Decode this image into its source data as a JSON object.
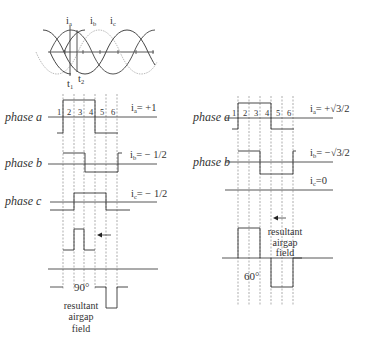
{
  "sine_plot": {
    "labels": [
      "i",
      "i",
      "i"
    ],
    "label_subs": [
      "a",
      "b",
      "c"
    ],
    "time_markers": [
      "t",
      "t"
    ],
    "time_subs": [
      "1",
      "2"
    ]
  },
  "left_panel": {
    "phases": [
      {
        "label": "phase a",
        "current_label": "i",
        "current_sub": "a",
        "current_value": "= +1"
      },
      {
        "label": "phase b",
        "current_label": "i",
        "current_sub": "b",
        "current_value": "= − 1/2"
      },
      {
        "label": "phase c",
        "current_label": "i",
        "current_sub": "c",
        "current_value": "= − 1/2"
      }
    ],
    "intervals": [
      "1",
      "2",
      "3",
      "4",
      "5",
      "6"
    ],
    "angle": "90°",
    "caption": [
      "resultant",
      "airgap",
      "field"
    ]
  },
  "right_panel": {
    "phases": [
      {
        "label": "phase a",
        "current_label": "i",
        "current_sub": "a",
        "current_value": "= +√3/2"
      },
      {
        "label": "phase b",
        "current_label": "i",
        "current_sub": "b",
        "current_value": "= −√3/2"
      },
      {
        "label": "",
        "current_label": "i",
        "current_sub": "c",
        "current_value": "=0"
      }
    ],
    "intervals": [
      "1",
      "2",
      "3",
      "4",
      "5",
      "6"
    ],
    "angle": "60°",
    "caption": [
      "resultant",
      "airgap",
      "field"
    ]
  },
  "icons": {
    "arrow_left": "field-direction-arrow"
  }
}
